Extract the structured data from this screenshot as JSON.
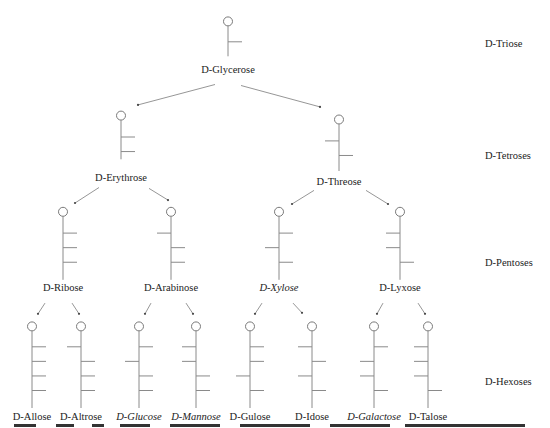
{
  "figure": {
    "type": "aldose-family-tree",
    "colors": {
      "bond": "#8a8a8a",
      "ring": "#7a7a7a",
      "text": "#222222"
    },
    "levels": [
      {
        "id": "triose",
        "label": "D-Triose",
        "x": 485,
        "y": 47
      },
      {
        "id": "tetroses",
        "label": "D-Tetroses",
        "x": 485,
        "y": 159
      },
      {
        "id": "pentoses",
        "label": "D-Pentoses",
        "x": 485,
        "y": 266
      },
      {
        "id": "hexoses",
        "label": "D-Hexoses",
        "x": 485,
        "y": 385
      }
    ],
    "sugars": [
      {
        "id": "glycerose",
        "name": "D-Glycerose",
        "italic": false,
        "x": 228,
        "top": 22,
        "bottom": 58,
        "branchStart": 43,
        "branches": [
          "R"
        ],
        "labelY": 77
      },
      {
        "id": "erythrose",
        "name": "D-Erythrose",
        "italic": false,
        "x": 121,
        "top": 119,
        "bottom": 164,
        "branchStart": 141,
        "branches": [
          "R",
          "R"
        ],
        "labelY": 188
      },
      {
        "id": "threose",
        "name": "D-Threose",
        "italic": false,
        "x": 339,
        "top": 123,
        "bottom": 176,
        "branchStart": 145,
        "branches": [
          "L",
          "R"
        ],
        "labelY": 192
      },
      {
        "id": "ribose",
        "name": "D-Ribose",
        "italic": false,
        "x": 63,
        "top": 218,
        "bottom": 288,
        "branchStart": 240,
        "branches": [
          "R",
          "R",
          "R"
        ],
        "labelY": 302
      },
      {
        "id": "arabinose",
        "name": "D-Arabinose",
        "italic": false,
        "x": 171,
        "top": 218,
        "bottom": 288,
        "branchStart": 240,
        "branches": [
          "L",
          "R",
          "R"
        ],
        "labelY": 302
      },
      {
        "id": "xylose",
        "name": "D-Xylose",
        "italic": true,
        "x": 279,
        "top": 218,
        "bottom": 288,
        "branchStart": 240,
        "branches": [
          "R",
          "L",
          "R"
        ],
        "labelY": 302
      },
      {
        "id": "lyxose",
        "name": "D-Lyxose",
        "italic": false,
        "x": 400,
        "top": 218,
        "bottom": 288,
        "branchStart": 240,
        "branches": [
          "L",
          "L",
          "R"
        ],
        "labelY": 302
      },
      {
        "id": "allose",
        "name": "D-Allose",
        "italic": false,
        "x": 32,
        "top": 336,
        "bottom": 420,
        "branchStart": 357,
        "branches": [
          "R",
          "R",
          "R",
          "R"
        ],
        "labelY": 434
      },
      {
        "id": "altrose",
        "name": "D-Altrose",
        "italic": false,
        "x": 81,
        "top": 336,
        "bottom": 420,
        "branchStart": 357,
        "branches": [
          "L",
          "R",
          "R",
          "R"
        ],
        "labelY": 434
      },
      {
        "id": "glucose",
        "name": "D-Glucose",
        "italic": true,
        "x": 139,
        "top": 336,
        "bottom": 420,
        "branchStart": 357,
        "branches": [
          "R",
          "L",
          "R",
          "R"
        ],
        "labelY": 434
      },
      {
        "id": "mannose",
        "name": "D-Mannose",
        "italic": true,
        "x": 196,
        "top": 336,
        "bottom": 420,
        "branchStart": 357,
        "branches": [
          "L",
          "L",
          "R",
          "R"
        ],
        "labelY": 434
      },
      {
        "id": "gulose",
        "name": "D-Gulose",
        "italic": false,
        "x": 250,
        "top": 336,
        "bottom": 420,
        "branchStart": 357,
        "branches": [
          "R",
          "R",
          "L",
          "R"
        ],
        "labelY": 434
      },
      {
        "id": "idose",
        "name": "D-Idose",
        "italic": false,
        "x": 312,
        "top": 336,
        "bottom": 420,
        "branchStart": 357,
        "branches": [
          "L",
          "R",
          "L",
          "R"
        ],
        "labelY": 434
      },
      {
        "id": "galactose",
        "name": "D-Galactose",
        "italic": true,
        "x": 374,
        "top": 336,
        "bottom": 420,
        "branchStart": 357,
        "branches": [
          "R",
          "L",
          "L",
          "R"
        ],
        "labelY": 434
      },
      {
        "id": "talose",
        "name": "D-Talose",
        "italic": false,
        "x": 428,
        "top": 336,
        "bottom": 420,
        "branchStart": 357,
        "branches": [
          "L",
          "L",
          "L",
          "R"
        ],
        "labelY": 434
      }
    ],
    "arrows": [
      {
        "from": "glycerose",
        "to": "erythrose",
        "x1": 215,
        "y1": 87,
        "x2": 138,
        "y2": 108
      },
      {
        "from": "glycerose",
        "to": "threose",
        "x1": 241,
        "y1": 88,
        "x2": 320,
        "y2": 110
      },
      {
        "from": "erythrose",
        "to": "ribose",
        "x1": 99,
        "y1": 193,
        "x2": 75,
        "y2": 209
      },
      {
        "from": "erythrose",
        "to": "arabinose",
        "x1": 149,
        "y1": 194,
        "x2": 168,
        "y2": 206
      },
      {
        "from": "threose",
        "to": "xylose",
        "x1": 314,
        "y1": 196,
        "x2": 292,
        "y2": 210
      },
      {
        "from": "threose",
        "to": "lyxose",
        "x1": 366,
        "y1": 196,
        "x2": 388,
        "y2": 210
      },
      {
        "from": "ribose",
        "to": "allose",
        "x1": 45,
        "y1": 312,
        "x2": 38,
        "y2": 323
      },
      {
        "from": "ribose",
        "to": "altrose",
        "x1": 72,
        "y1": 312,
        "x2": 79,
        "y2": 323
      },
      {
        "from": "arabinose",
        "to": "glucose",
        "x1": 151,
        "y1": 312,
        "x2": 145,
        "y2": 323
      },
      {
        "from": "arabinose",
        "to": "mannose",
        "x1": 186,
        "y1": 312,
        "x2": 193,
        "y2": 323
      },
      {
        "from": "xylose",
        "to": "gulose",
        "x1": 262,
        "y1": 312,
        "x2": 255,
        "y2": 323
      },
      {
        "from": "xylose",
        "to": "idose",
        "x1": 293,
        "y1": 312,
        "x2": 302,
        "y2": 322
      },
      {
        "from": "lyxose",
        "to": "galactose",
        "x1": 383,
        "y1": 312,
        "x2": 377,
        "y2": 323
      },
      {
        "from": "lyxose",
        "to": "talose",
        "x1": 418,
        "y1": 312,
        "x2": 425,
        "y2": 323
      }
    ]
  }
}
